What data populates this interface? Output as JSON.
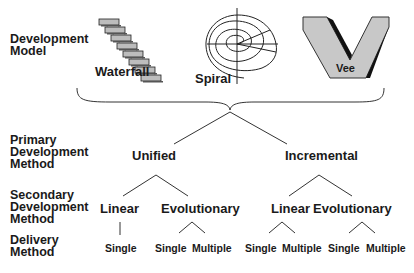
{
  "row_labels": {
    "development_model": [
      "Development",
      "Model"
    ],
    "primary": [
      "Primary",
      "Development",
      "Method"
    ],
    "secondary": [
      "Secondary",
      "Development",
      "Method"
    ],
    "delivery": [
      "Delivery",
      "Method"
    ]
  },
  "models": {
    "waterfall": "Waterfall",
    "spiral": "Spiral",
    "vee": "Vee"
  },
  "primary_methods": {
    "unified": "Unified",
    "incremental": "Incremental"
  },
  "secondary_methods": {
    "unified_linear": "Linear",
    "unified_evolutionary": "Evolutionary",
    "incremental_linear": "Linear",
    "incremental_evolutionary": "Evolutionary"
  },
  "delivery_methods": {
    "unified_linear_single": "Single",
    "unified_evo_single": "Single",
    "unified_evo_multiple": "Multiple",
    "incr_linear_single": "Single",
    "incr_linear_multiple": "Multiple",
    "incr_evo_single": "Single",
    "incr_evo_multiple": "Multiple"
  },
  "colors": {
    "text": "#1a1a1a",
    "line": "#333333",
    "vee_fill": "#c8c8c8",
    "vee_shadow": "#111111",
    "waterfall_box": "#bdbdbd"
  }
}
